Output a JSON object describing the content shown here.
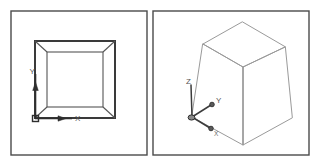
{
  "figure": {
    "background_color": "#ffffff",
    "frame_color": "#4a4a4a",
    "edge_color": "#9a9a9a",
    "topview_edge_color": "#3a3a3a",
    "ucs_color": "#2e2e2e"
  },
  "left_panel": {
    "name": "top-view-panel",
    "view_type": "top-view",
    "shape": "truncated-pyramid-top-view",
    "ucs": {
      "type": "2d-ucs-icon",
      "origin_marker": "square",
      "axes": [
        {
          "id": "x",
          "label": "X",
          "direction": "right"
        },
        {
          "id": "y",
          "label": "Y",
          "direction": "up"
        }
      ]
    }
  },
  "right_panel": {
    "name": "isometric-view-panel",
    "view_type": "isometric-view",
    "shape": "truncated-pyramid",
    "ucs": {
      "type": "3d-ucs-icon",
      "origin_marker": "ball",
      "axes": [
        {
          "id": "z",
          "label": "Z",
          "direction": "up"
        },
        {
          "id": "y",
          "label": "Y",
          "direction": "up-right"
        },
        {
          "id": "x",
          "label": "X",
          "direction": "down-right"
        }
      ]
    }
  }
}
